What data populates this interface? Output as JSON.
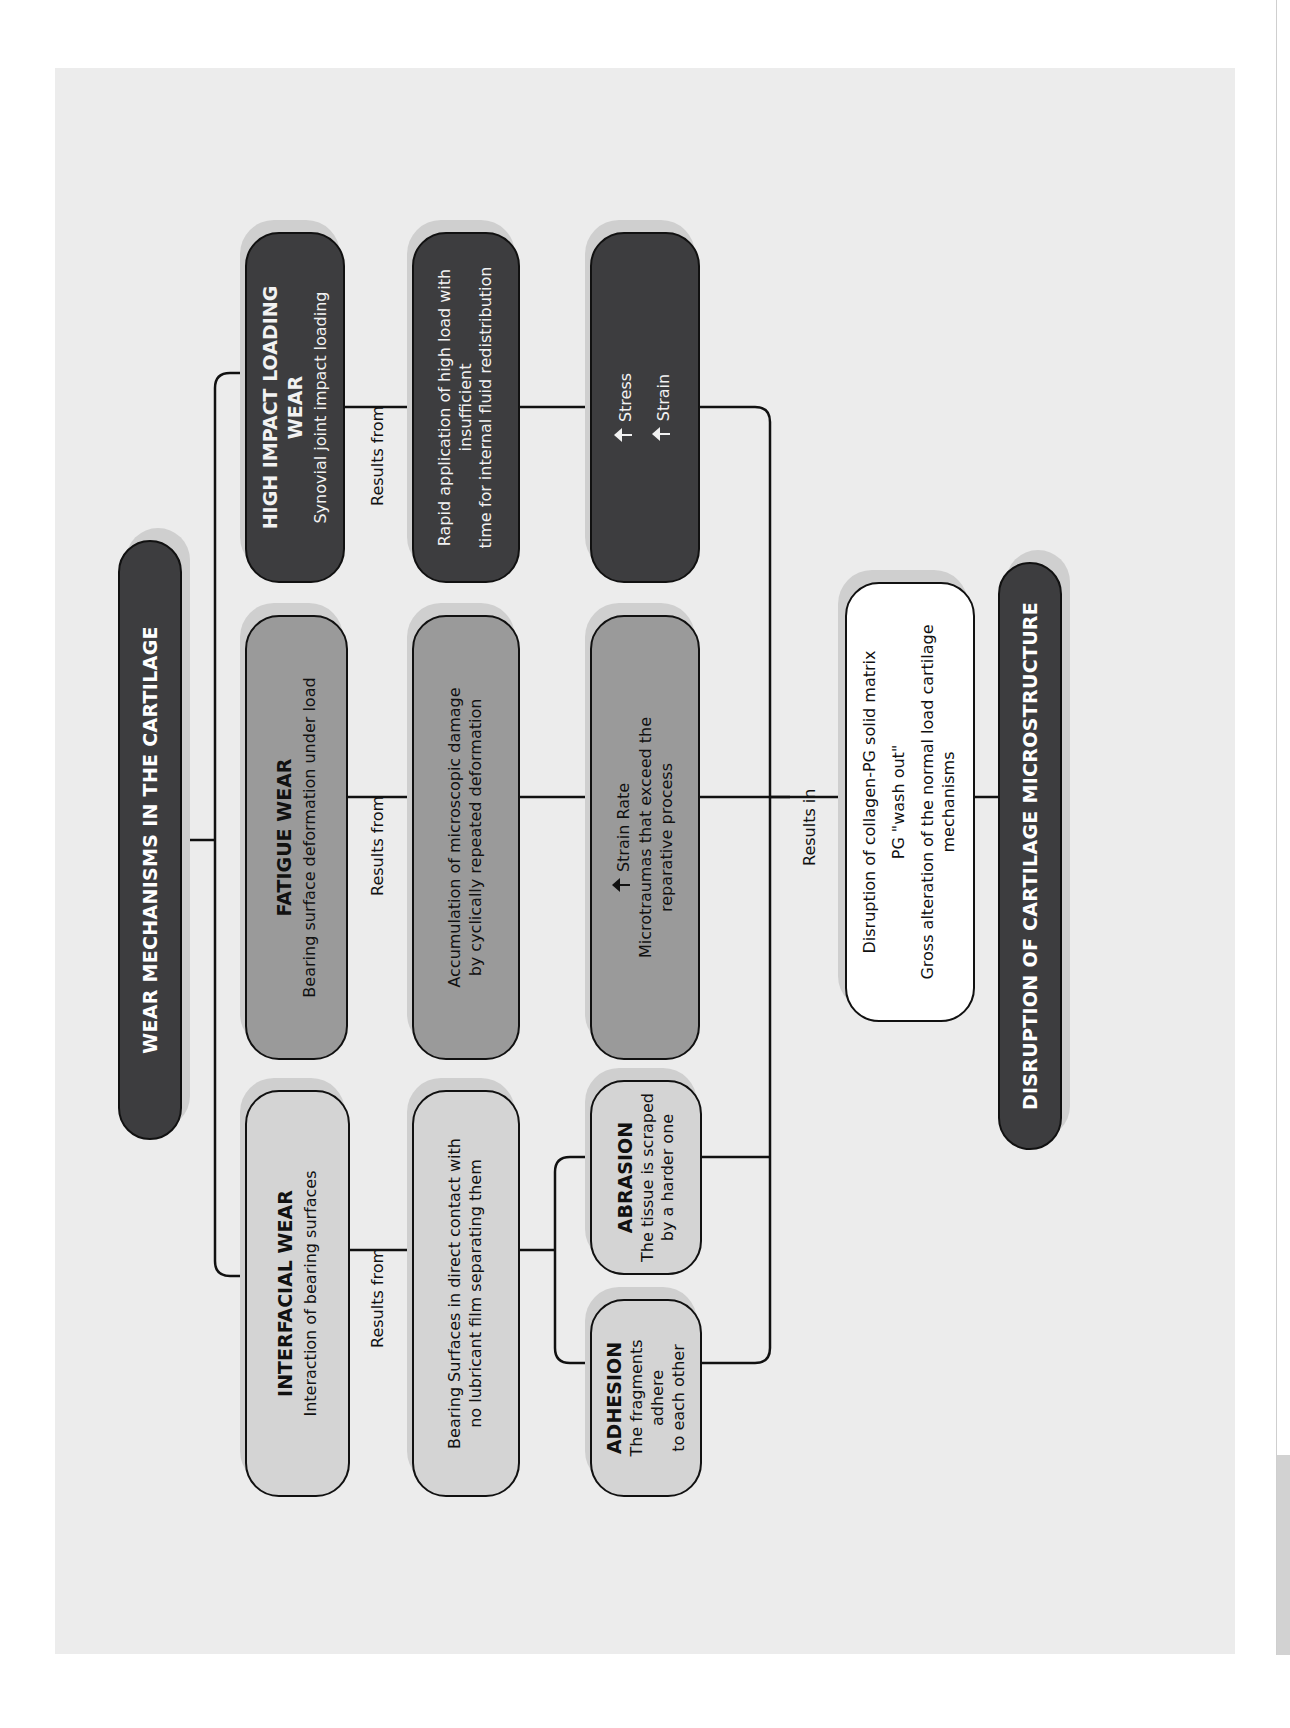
{
  "diagram": {
    "title": "WEAR MECHANISMS IN THE CARTILAGE",
    "categories": [
      {
        "id": "interfacial",
        "heading": "INTERFACIAL WEAR",
        "subheading": "Interaction of bearing surfaces",
        "connector_label": "Results from",
        "cause": "Bearing Surfaces in direct contact with no lubricant film separating them",
        "cause_lines": [
          "Bearing Surfaces in direct contact with",
          "no lubricant film separating them"
        ],
        "subtypes": [
          {
            "heading": "ABRASION",
            "lines": [
              "The tissue is scraped",
              "by a harder one"
            ]
          },
          {
            "heading": "ADHESION",
            "lines": [
              "The fragments adhere",
              "to each other"
            ]
          }
        ]
      },
      {
        "id": "fatigue",
        "heading": "FATIGUE WEAR",
        "subheading": "Bearing surface deformation under load",
        "connector_label": "Results from",
        "cause_lines": [
          "Accumulation of microscopic damage",
          "by cyclically repeated deformation"
        ],
        "effect_indicator": {
          "icon": "arrow-up-icon",
          "label": "Strain Rate"
        },
        "effect_lines": [
          "Microtraumas that exceed the",
          "reparative process"
        ]
      },
      {
        "id": "high_impact",
        "heading": "HIGH IMPACT LOADING WEAR",
        "subheading": "Synovial joint impact loading",
        "connector_label": "Results from",
        "cause_lines": [
          "Rapid application of high load with insufficient",
          "time for internal fluid redistribution"
        ],
        "effect_indicators": [
          {
            "icon": "arrow-up-icon",
            "label": "Stress"
          },
          {
            "icon": "arrow-up-icon",
            "label": "Strain"
          }
        ]
      }
    ],
    "results_in_label": "Results in",
    "outcome_lines": [
      "Disruption of collagen-PG solid matrix",
      "PG \"wash out\"",
      "Gross alteration of the normal load cartilage mechanisms"
    ],
    "final": "DISRUPTION OF CARTILAGE MICROSTRUCTURE",
    "colors": {
      "dark": "#3d3d3f",
      "mid": "#9a9a9a",
      "light": "#d4d4d4",
      "white": "#ffffff",
      "background": "#ececec"
    }
  }
}
